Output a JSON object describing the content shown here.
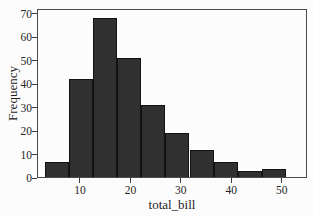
{
  "figure": {
    "background": "#fcfcfc",
    "bar_fill": "#303030",
    "bar_edge": "#121212",
    "axis_color": "#4a4a4a",
    "text_color": "#262626"
  },
  "chart_data": {
    "type": "bar",
    "subtype": "histogram",
    "title": "",
    "xlabel": "total_bill",
    "ylabel": "Frequency",
    "bin_edges": [
      3.07,
      7.84,
      12.62,
      17.39,
      22.17,
      26.94,
      31.71,
      36.49,
      41.26,
      46.03,
      50.81
    ],
    "values": [
      7,
      42,
      68,
      51,
      31,
      19,
      12,
      7,
      3,
      4
    ],
    "xlim": [
      1.5,
      55
    ],
    "ylim": [
      0,
      72
    ],
    "x_ticks": [
      10,
      20,
      30,
      40,
      50
    ],
    "y_ticks": [
      0,
      10,
      20,
      30,
      40,
      50,
      60,
      70
    ],
    "grid": false,
    "frame": true,
    "legend": null
  }
}
